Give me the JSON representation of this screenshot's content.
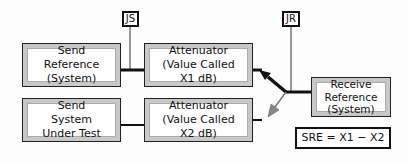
{
  "diagram": {
    "labels": {
      "js": "JS",
      "jr": "JR"
    },
    "boxes": {
      "send_reference": [
        "Send",
        "Reference",
        "(System)"
      ],
      "attenuator_x1": [
        "Attenuator",
        "(Value Called",
        "X1 dB)"
      ],
      "send_sut": [
        "Send",
        "System",
        "Under Test"
      ],
      "attenuator_x2": [
        "Attenuator",
        "(Value Called",
        "X2 dB)"
      ],
      "receive_reference": [
        "Receive",
        "Reference",
        "(System)"
      ]
    },
    "formula": "SRE = X1 − X2",
    "colors": {
      "line": "#111111",
      "switch_active": "#111111",
      "switch_inactive": "#777777",
      "box_shade": "#c8c8c8"
    }
  }
}
